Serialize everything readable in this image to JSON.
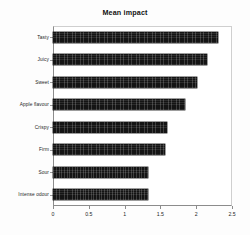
{
  "chart_data": {
    "type": "bar",
    "orientation": "horizontal",
    "title": "Mean impact",
    "xlabel": "",
    "ylabel": "",
    "categories": [
      "Tasty",
      "Juicy",
      "Sweet",
      "Apple flavour",
      "Crispy",
      "Firm",
      "Sour",
      "Intense odour"
    ],
    "values": [
      2.3,
      2.15,
      2.01,
      1.84,
      1.59,
      1.56,
      1.33,
      1.32
    ],
    "xlim": [
      0,
      2.5
    ],
    "xticks": [
      "0",
      "0.5",
      "1",
      "1.5",
      "2",
      "2.5"
    ],
    "xtick_values": [
      0,
      0.5,
      1,
      1.5,
      2,
      2.5
    ],
    "grid": false,
    "legend": null,
    "series_color": "#141414"
  },
  "figure": {
    "title": "Mean impact",
    "caption_artifact": ""
  }
}
